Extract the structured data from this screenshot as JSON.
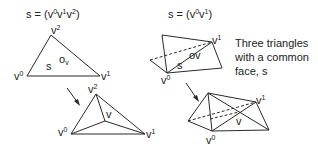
{
  "left": {
    "formula": {
      "prefix": "s = (v",
      "s0": "0",
      "v1": "v",
      "s1": "1",
      "v2": "v",
      "s2": "2",
      "suffix": ")"
    },
    "top_triangle": {
      "v0": "v",
      "v0_sup": "0",
      "v1": "v",
      "v1_sup": "1",
      "v2": "v",
      "v2_sup": "2",
      "face": "s",
      "point": "o",
      "point_sub": "v"
    },
    "bottom_triangle": {
      "v0": "v",
      "v0_sup": "0",
      "v1": "v",
      "v1_sup": "1",
      "v2": "v",
      "v2_sup": "2",
      "center": "v"
    }
  },
  "right": {
    "formula": {
      "prefix": "s = (v",
      "s0": "0",
      "v1": "v",
      "s1": "1",
      "suffix": ")"
    },
    "top_figure": {
      "v0": "v",
      "v0_sup": "0",
      "v1": "v",
      "v1_sup": "1",
      "face": "s",
      "point": "ov"
    },
    "bottom_figure": {
      "v0": "v",
      "v0_sup": "0",
      "v1": "v",
      "v1_sup": "1",
      "center": "v"
    },
    "caption": [
      "Three triangles",
      "with a common",
      "face, s"
    ]
  }
}
